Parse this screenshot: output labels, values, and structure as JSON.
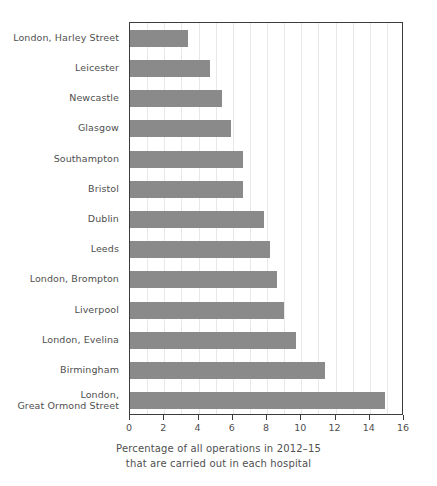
{
  "chart_data": {
    "type": "bar",
    "orientation": "horizontal",
    "title": "",
    "subtitle": "",
    "xlabel_line1": "Percentage of all operations in 2012–15",
    "xlabel_line2": "that are carried out in each hospital",
    "ylabel": "",
    "xlim": [
      0,
      16
    ],
    "ylim": null,
    "grid": "vertical",
    "legend": null,
    "bar_color": "#8a8a8a",
    "axis_color": "#3c3c3c",
    "gridline_color": "#e8e8e8",
    "text_color": "#4f4f4f",
    "xticks": [
      0,
      2,
      4,
      6,
      8,
      10,
      12,
      14,
      16
    ],
    "xtick_labels": [
      "0",
      "2",
      "4",
      "6",
      "8",
      "10",
      "12",
      "14",
      "16"
    ],
    "categories": [
      "London, Harley Street",
      "Leicester",
      "Newcastle",
      "Glasgow",
      "Southampton",
      "Bristol",
      "Dublin",
      "Leeds",
      "London, Brompton",
      "Liverpool",
      "London, Evelina",
      "Birmingham",
      "London,\nGreat Ormond Street"
    ],
    "values": [
      3.4,
      4.7,
      5.4,
      5.9,
      6.6,
      6.6,
      7.8,
      8.2,
      8.6,
      9.0,
      9.7,
      11.4,
      14.9
    ]
  }
}
